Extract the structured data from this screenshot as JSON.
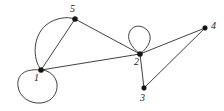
{
  "figure": {
    "kind": "undirected-multigraph-drawing",
    "background_color": "#ffffff",
    "stroke_color": "#2b2b2b",
    "vertex_color": "#151515",
    "width": 224,
    "height": 111
  },
  "chart_data": {
    "type": "diagram",
    "title": "",
    "nodes": [
      {
        "id": "1",
        "label": "1",
        "x": 41,
        "y": 70,
        "label_x": 34,
        "label_y": 73
      },
      {
        "id": "2",
        "label": "2",
        "x": 140,
        "y": 54,
        "label_x": 134,
        "label_y": 57
      },
      {
        "id": "3",
        "label": "3",
        "x": 144,
        "y": 88,
        "label_x": 140,
        "label_y": 93
      },
      {
        "id": "4",
        "label": "4",
        "x": 205,
        "y": 28,
        "label_x": 211,
        "label_y": 21
      },
      {
        "id": "5",
        "label": "5",
        "x": 75,
        "y": 19,
        "label_x": 70,
        "label_y": 4
      }
    ],
    "edges": [
      {
        "source": "1",
        "target": "1",
        "kind": "self-loop"
      },
      {
        "source": "2",
        "target": "2",
        "kind": "self-loop"
      },
      {
        "source": "1",
        "target": "5",
        "kind": "curved"
      },
      {
        "source": "1",
        "target": "5",
        "kind": "straight"
      },
      {
        "source": "1",
        "target": "2",
        "kind": "straight"
      },
      {
        "source": "5",
        "target": "2",
        "kind": "straight"
      },
      {
        "source": "2",
        "target": "3",
        "kind": "straight"
      },
      {
        "source": "2",
        "target": "4",
        "kind": "straight"
      },
      {
        "source": "3",
        "target": "4",
        "kind": "straight"
      }
    ],
    "degrees": {
      "1": 5,
      "2": 6,
      "3": 2,
      "4": 2,
      "5": 3
    }
  },
  "paths": {
    "loop_1": "M 41 70 C 21 68 17 78 18 86 C 19 97 30 104 41 103 C 52 102 58 93 57 84 C 56 76 49 70 41 70 Z",
    "loop_2": "M 140 54 C 131 47 126 38 130 31 C 134 24 143 25 148 31 C 153 38 149 47 140 54 Z",
    "edge_1_5_curved": "M 41 70 C 32 58 33 36 46 25 C 55 18 67 16 75 19",
    "edge_1_5_straight": "M 41 70 L 75 19",
    "edge_1_2": "M 41 70 L 140 54",
    "edge_5_2": "M 75 19 L 140 54",
    "edge_2_3": "M 140 54 L 144 88",
    "edge_2_4": "M 140 54 L 205 28",
    "edge_3_4": "M 144 88 L 205 28"
  }
}
